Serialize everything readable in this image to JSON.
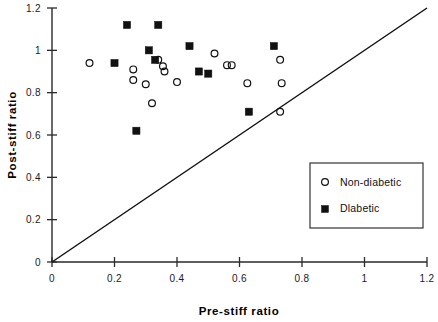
{
  "chart_data": {
    "type": "scatter",
    "title": "",
    "xlabel": "Pre-stiff   ratio",
    "ylabel": "Post-stiff   ratio",
    "xlim": [
      0,
      1.2
    ],
    "ylim": [
      0,
      1.2
    ],
    "xticks": [
      "0",
      "0.2",
      "0.4",
      "0.6",
      "0.8",
      "1",
      "1.2"
    ],
    "xtick_values": [
      0,
      0.2,
      0.4,
      0.6,
      0.8,
      1,
      1.2
    ],
    "yticks": [
      "0",
      "0.2",
      "0.4",
      "0.6",
      "0.8",
      "1",
      "1.2"
    ],
    "ytick_values": [
      0,
      0.2,
      0.4,
      0.6,
      0.8,
      1,
      1.2
    ],
    "grid": false,
    "legend_position": "lower-right",
    "reference_line": {
      "name": "identity-line",
      "from": [
        0,
        0
      ],
      "to": [
        1.2,
        1.2
      ]
    },
    "series": [
      {
        "name": "Non-diabetic",
        "marker": "open-circle",
        "color": "#111111",
        "points": [
          [
            0.12,
            0.94
          ],
          [
            0.26,
            0.91
          ],
          [
            0.26,
            0.86
          ],
          [
            0.3,
            0.84
          ],
          [
            0.32,
            0.75
          ],
          [
            0.34,
            0.955
          ],
          [
            0.355,
            0.925
          ],
          [
            0.36,
            0.9
          ],
          [
            0.4,
            0.85
          ],
          [
            0.52,
            0.985
          ],
          [
            0.56,
            0.93
          ],
          [
            0.575,
            0.93
          ],
          [
            0.625,
            0.845
          ],
          [
            0.73,
            0.955
          ],
          [
            0.735,
            0.845
          ],
          [
            0.73,
            0.71
          ]
        ]
      },
      {
        "name": "Diabetic",
        "marker": "filled-square",
        "color": "#111111",
        "points": [
          [
            0.24,
            1.12
          ],
          [
            0.34,
            1.12
          ],
          [
            0.2,
            0.94
          ],
          [
            0.31,
            1.0
          ],
          [
            0.33,
            0.955
          ],
          [
            0.44,
            1.02
          ],
          [
            0.47,
            0.9
          ],
          [
            0.5,
            0.89
          ],
          [
            0.71,
            1.02
          ],
          [
            0.27,
            0.62
          ],
          [
            0.63,
            0.71
          ]
        ]
      }
    ]
  },
  "legend": {
    "entries": [
      {
        "label": "Non-diabetic",
        "marker": "open-circle"
      },
      {
        "label": "Dlabetic",
        "marker": "filled-square"
      }
    ]
  }
}
